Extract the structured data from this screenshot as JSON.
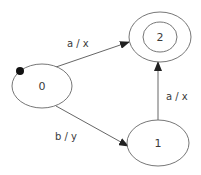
{
  "diagram": {
    "type": "finite-state-machine",
    "states": [
      {
        "id": "0",
        "label": "0",
        "initial": true,
        "accepting": false
      },
      {
        "id": "1",
        "label": "1",
        "initial": false,
        "accepting": false
      },
      {
        "id": "2",
        "label": "2",
        "initial": false,
        "accepting": true
      }
    ],
    "transitions": [
      {
        "from": "0",
        "to": "2",
        "label": "a / x"
      },
      {
        "from": "0",
        "to": "1",
        "label": "b / y"
      },
      {
        "from": "1",
        "to": "2",
        "label": "a / x"
      }
    ],
    "colors": {
      "stroke": "#555555",
      "text": "#3a3a3a",
      "initial_marker": "#111111"
    }
  }
}
